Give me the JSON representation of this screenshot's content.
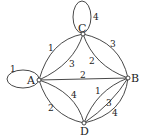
{
  "diagram": {
    "type": "weighted multigraph",
    "nodes": [
      {
        "id": "A",
        "label": "A"
      },
      {
        "id": "B",
        "label": "B"
      },
      {
        "id": "C",
        "label": "C"
      },
      {
        "id": "D",
        "label": "D"
      }
    ],
    "edges": [
      {
        "from": "A",
        "to": "A",
        "weight": "1",
        "kind": "loop"
      },
      {
        "from": "C",
        "to": "C",
        "weight": "4",
        "kind": "loop"
      },
      {
        "from": "A",
        "to": "C",
        "weight": "1",
        "kind": "outer-curve"
      },
      {
        "from": "A",
        "to": "C",
        "weight": "3",
        "kind": "inner-curve"
      },
      {
        "from": "C",
        "to": "B",
        "weight": "2",
        "kind": "inner-curve"
      },
      {
        "from": "C",
        "to": "B",
        "weight": "3",
        "kind": "outer-curve"
      },
      {
        "from": "A",
        "to": "B",
        "weight": "2",
        "kind": "straight"
      },
      {
        "from": "A",
        "to": "D",
        "weight": "2",
        "kind": "outer-curve"
      },
      {
        "from": "A",
        "to": "D",
        "weight": "4",
        "kind": "inner-curve"
      },
      {
        "from": "D",
        "to": "B",
        "weight": "1",
        "kind": "inner-curve"
      },
      {
        "from": "D",
        "to": "B",
        "weight": "3",
        "kind": "middle-curve"
      },
      {
        "from": "D",
        "to": "B",
        "weight": "4",
        "kind": "outer-curve"
      }
    ]
  }
}
